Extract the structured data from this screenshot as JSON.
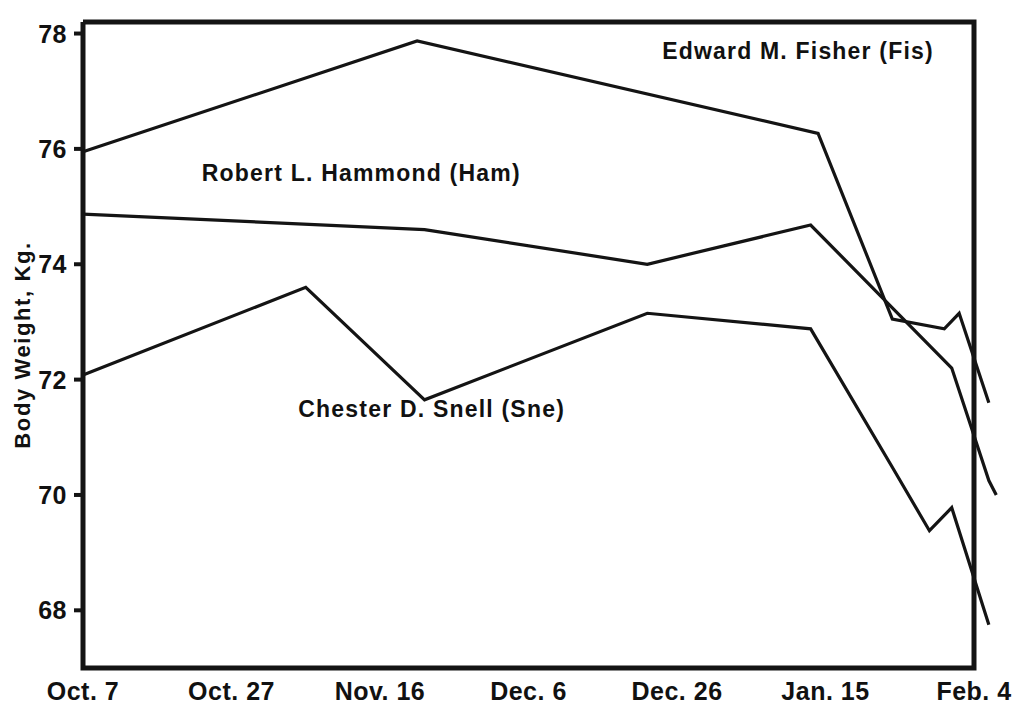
{
  "chart_data": {
    "type": "line",
    "title": "",
    "xlabel": "",
    "ylabel": "Body Weight, Kg.",
    "xlim": [
      0,
      120
    ],
    "ylim": [
      67.0,
      78.2
    ],
    "grid": false,
    "legend": "inline-labels",
    "y_ticks": [
      78,
      76,
      74,
      72,
      70,
      68
    ],
    "y_tick_labels": [
      "78",
      "76",
      "74",
      "72",
      "70",
      "68"
    ],
    "x_ticks": [
      0,
      20,
      40,
      60,
      80,
      100,
      120
    ],
    "x_tick_labels": [
      "Oct. 7",
      "Oct. 27",
      "Nov. 16",
      "Dec. 6",
      "Dec. 26",
      "Jan. 15",
      "Feb. 4"
    ],
    "series": [
      {
        "name": "Edward M. Fisher (Fis)",
        "short": "Fis",
        "color": "#141414",
        "label_x": 78,
        "label_y": 77.55,
        "x": [
          0,
          45,
          99,
          109,
          116,
          118,
          122
        ],
        "y": [
          75.95,
          77.87,
          76.27,
          73.05,
          72.88,
          73.15,
          71.6
        ],
        "points": [
          {
            "x": "Oct. 7",
            "y": 75.95
          },
          {
            "x": "Nov. 21",
            "y": 77.87
          },
          {
            "x": "Jan. 14",
            "y": 76.27
          },
          {
            "x": "Jan. 24",
            "y": 73.05
          },
          {
            "x": "Jan. 31",
            "y": 72.88
          },
          {
            "x": "Feb. 2",
            "y": 73.15
          },
          {
            "x": "Feb. 6",
            "y": 71.6
          }
        ]
      },
      {
        "name": "Robert L. Hammond (Ham)",
        "short": "Ham",
        "color": "#141414",
        "label_x": 16,
        "label_y": 75.45,
        "x": [
          0,
          46,
          76,
          98,
          117,
          122,
          123
        ],
        "y": [
          74.87,
          74.6,
          74.0,
          74.68,
          72.2,
          70.25,
          70.0
        ],
        "points": [
          {
            "x": "Oct. 7",
            "y": 74.87
          },
          {
            "x": "Nov. 22",
            "y": 74.6
          },
          {
            "x": "Dec. 22",
            "y": 74.0
          },
          {
            "x": "Jan. 13",
            "y": 74.68
          },
          {
            "x": "Feb. 1",
            "y": 72.2
          },
          {
            "x": "Feb. 6",
            "y": 70.25
          },
          {
            "x": "Feb. 7",
            "y": 70.0
          }
        ]
      },
      {
        "name": "Chester D. Snell (Sne)",
        "short": "Sne",
        "color": "#141414",
        "label_x": 29,
        "label_y": 71.35,
        "x": [
          0,
          30,
          46,
          76,
          98,
          109,
          114,
          117,
          122
        ],
        "y": [
          72.08,
          73.6,
          71.65,
          73.15,
          72.88,
          70.48,
          69.38,
          69.78,
          67.75
        ],
        "points": [
          {
            "x": "Oct. 7",
            "y": 72.08
          },
          {
            "x": "Nov. 6",
            "y": 73.6
          },
          {
            "x": "Nov. 22",
            "y": 71.65
          },
          {
            "x": "Dec. 22",
            "y": 73.15
          },
          {
            "x": "Jan. 13",
            "y": 72.88
          },
          {
            "x": "Jan. 24",
            "y": 70.48
          },
          {
            "x": "Jan. 29",
            "y": 69.38
          },
          {
            "x": "Feb. 1",
            "y": 69.78
          },
          {
            "x": "Feb. 6",
            "y": 67.75
          }
        ]
      }
    ]
  }
}
